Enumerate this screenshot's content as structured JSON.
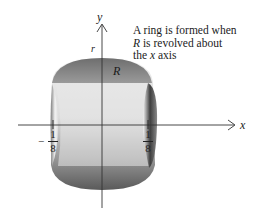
{
  "figure": {
    "caption_line1": "A ring is formed when",
    "caption_line2_var": "R",
    "caption_line2_rest": " is revolved about",
    "caption_line3_pre": "the ",
    "caption_line3_var": "x",
    "caption_line3_post": " axis",
    "y_axis_label": "y",
    "x_axis_label": "x",
    "radius_label": "r",
    "region_label": "R",
    "left_tick": {
      "sign": "−",
      "numerator": "1",
      "denominator": "8"
    },
    "right_tick": {
      "numerator": "1",
      "denominator": "8"
    }
  },
  "colors": {
    "axis": "#333333",
    "shade_dark": "#5a5a5a",
    "shade_light": "#e6e6e6"
  }
}
